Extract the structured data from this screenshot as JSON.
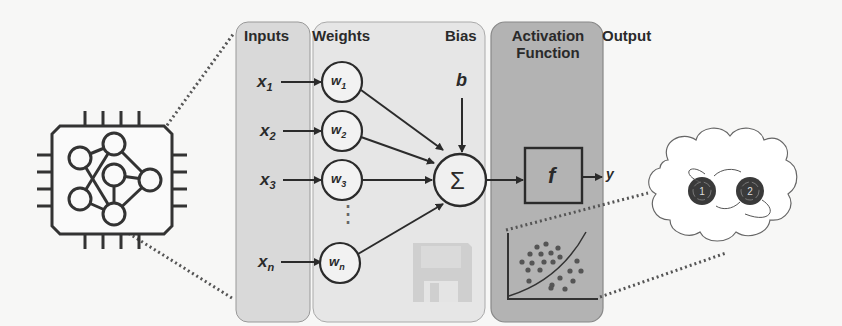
{
  "diagram": {
    "sections": {
      "inputs": "Inputs",
      "weights": "Weights",
      "bias": "Bias",
      "activation_line1": "Activation",
      "activation_line2": "Function",
      "output": "Output"
    },
    "inputs": [
      {
        "var": "x",
        "sub": "1"
      },
      {
        "var": "x",
        "sub": "2"
      },
      {
        "var": "x",
        "sub": "3"
      },
      {
        "var": "x",
        "sub": "n"
      }
    ],
    "weights": [
      {
        "var": "w",
        "sub": "1"
      },
      {
        "var": "w",
        "sub": "2"
      },
      {
        "var": "w",
        "sub": "3"
      },
      {
        "var": "w",
        "sub": "n"
      }
    ],
    "ellipsis": "⋮",
    "bias_symbol": "b",
    "sum_symbol": "Σ",
    "activation_symbol": "f",
    "output_symbol": "y",
    "state_nodes": [
      "1",
      "2"
    ],
    "icons": [
      "neural-chip-icon",
      "floppy-disk-icon",
      "scatter-classification-icon",
      "state-cloud-icon"
    ],
    "colors": {
      "background": "#f7f7f6",
      "inputs_panel": "#d9d9d9",
      "weights_panel": "#e6e6e6",
      "activation_panel": "#b3b3b3",
      "stroke": "#2b2b2b",
      "state_node": "#3a3a3a"
    }
  }
}
